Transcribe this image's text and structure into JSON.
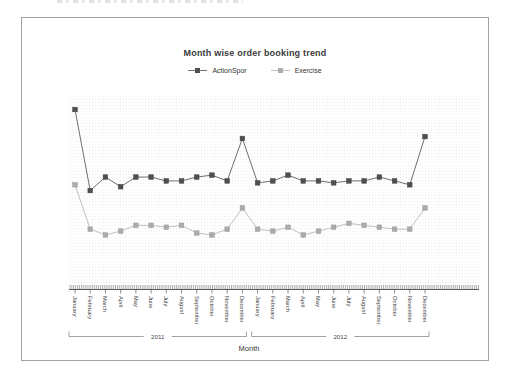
{
  "window": {
    "background": "#ffffff"
  },
  "chart": {
    "title": "Month wise order booking trend",
    "xlabel": "Month",
    "legend": [
      {
        "label": "ActionSpor",
        "color": "#4f4f4f",
        "line_color": "#6f6f6f"
      },
      {
        "label": "Exercise",
        "color": "#ababab",
        "line_color": "#c0c0c0"
      }
    ],
    "x_groups": [
      {
        "label": "2011"
      },
      {
        "label": "2012"
      }
    ],
    "border_color": "#a2a2a2",
    "axis_color": "#5a5a5a",
    "tick_label_color": "#3c3c3c",
    "bracket_color": "#8a8a8a",
    "grid_dot_color": "#ededed"
  },
  "chart_data": {
    "type": "line",
    "title": "Month wise order booking trend",
    "xlabel": "Month",
    "ylabel": "",
    "y_axis_shown": false,
    "note": "No y-axis scale is rendered in the chart; series values are relative estimates (0-100 of plot height) read from marker positions.",
    "legend_position": "top-center",
    "grid": "faint vertical dotted columns",
    "ylim": [
      0,
      100
    ],
    "categories": [
      "January",
      "February",
      "March",
      "April",
      "May",
      "June",
      "July",
      "August",
      "September",
      "October",
      "November",
      "December",
      "January",
      "February",
      "March",
      "April",
      "May",
      "June",
      "July",
      "August",
      "September",
      "October",
      "November",
      "December"
    ],
    "groups": [
      {
        "label": "2011",
        "start": 0,
        "end": 11
      },
      {
        "label": "2012",
        "start": 12,
        "end": 23
      }
    ],
    "series": [
      {
        "name": "ActionSpor",
        "color": "#4f4f4f",
        "line_color": "#6f6f6f",
        "values": [
          93,
          51,
          58,
          53,
          58,
          58,
          56,
          56,
          58,
          59,
          56,
          78,
          55,
          56,
          59,
          56,
          56,
          55,
          56,
          56,
          58,
          56,
          54,
          79
        ]
      },
      {
        "name": "Exercise",
        "color": "#ababab",
        "line_color": "#c0c0c0",
        "values": [
          54,
          31,
          28,
          30,
          33,
          33,
          32,
          33,
          29,
          28,
          31,
          42,
          31,
          30,
          32,
          28,
          30,
          32,
          34,
          33,
          32,
          31,
          31,
          42
        ]
      }
    ]
  }
}
